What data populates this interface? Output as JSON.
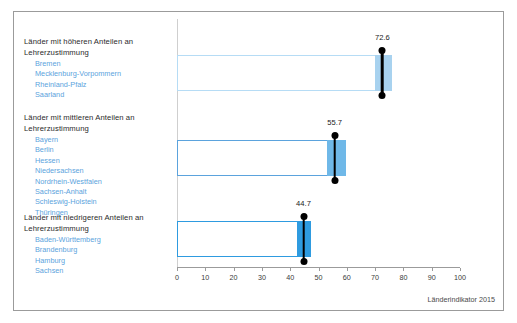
{
  "footer": {
    "source_note": "Länderindikator 2015"
  },
  "groups": [
    {
      "title": "Länder mit höheren Anteilen an Lehrerzustimmung",
      "states": [
        "Bremen",
        "Mecklenburg-Vorpommern",
        "Rheinland-Pfalz",
        "Saarland"
      ]
    },
    {
      "title": "Länder mit mittleren Anteilen an Lehrerzustimmung",
      "states": [
        "Bayern",
        "Berlin",
        "Hessen",
        "Niedersachsen",
        "Nordrhein-Westfalen",
        "Sachsen-Anhalt",
        "Schleswig-Holstein",
        "Thüringen"
      ]
    },
    {
      "title": "Länder mit niedrigeren Anteilen an Lehrerzustimmung",
      "states": [
        "Baden-Württemberg",
        "Brandenburg",
        "Hamburg",
        "Sachsen"
      ]
    }
  ],
  "chart_data": {
    "type": "bar",
    "title": "",
    "xlabel": "",
    "ylabel": "",
    "xlim": [
      0,
      100
    ],
    "xticks": [
      0,
      10,
      20,
      30,
      40,
      50,
      60,
      70,
      80,
      90,
      100
    ],
    "xtick_labels": [
      "0",
      "10",
      "20",
      "30",
      "40",
      "50",
      "60",
      "70",
      "80",
      "90",
      "100"
    ],
    "grid": false,
    "legend": "none",
    "orientation": "horizontal",
    "categories": [
      "Länder mit höheren Anteilen an Lehrerzustimmung",
      "Länder mit mittleren Anteilen an Lehrerzustimmung",
      "Länder mit niedrigeren Anteilen an Lehrerzustimmung"
    ],
    "values": [
      72.6,
      55.7,
      44.7
    ],
    "value_labels": [
      "72.6",
      "55.7",
      "44.7"
    ],
    "series": [
      {
        "name": "Anteil Lehrerzustimmung",
        "values": [
          72.6,
          55.7,
          44.7
        ],
        "boxes": [
          {
            "box_start": 0,
            "box_end": 76.0,
            "fill_start": 70.0,
            "fill_end": 76.0,
            "marker": 72.6,
            "fill_color": "#a8d2ef",
            "outline_color": "#b6dcf5"
          },
          {
            "box_start": 0,
            "box_end": 59.8,
            "fill_start": 53.0,
            "fill_end": 59.8,
            "marker": 55.7,
            "fill_color": "#6fb8e8",
            "outline_color": "#5ba3dd"
          },
          {
            "box_start": 0,
            "box_end": 47.2,
            "fill_start": 42.5,
            "fill_end": 47.2,
            "marker": 44.7,
            "fill_color": "#2e9be0",
            "outline_color": "#2e9be0"
          }
        ]
      }
    ]
  },
  "colors": {
    "accent_light": "#a8d2ef",
    "accent_mid": "#6fb8e8",
    "accent_strong": "#2e9be0",
    "state_text": "#5ba3dd",
    "marker": "#000000",
    "axis": "#9b9b9b"
  }
}
